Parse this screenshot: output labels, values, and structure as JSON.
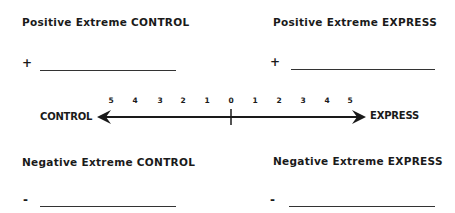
{
  "quadrants": {
    "positive_control": {
      "heading": "Positive Extreme CONTROL",
      "sign": "+",
      "value": ""
    },
    "positive_express": {
      "heading": "Positive Extreme EXPRESS",
      "sign": "+",
      "value": ""
    },
    "negative_control": {
      "heading": "Negative Extreme CONTROL",
      "sign": "-",
      "value": ""
    },
    "negative_express": {
      "heading": "Negative Extreme EXPRESS",
      "sign": "-",
      "value": ""
    }
  },
  "scale": {
    "left_label": "CONTROL",
    "right_label": "EXPRESS",
    "left_ticks": [
      "5",
      "4",
      "3",
      "2",
      "1"
    ],
    "center_tick": "0",
    "right_ticks": [
      "1",
      "2",
      "3",
      "4",
      "5"
    ]
  }
}
